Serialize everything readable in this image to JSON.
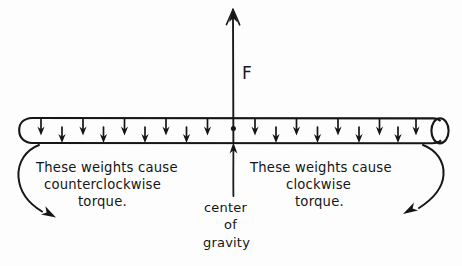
{
  "figure": {
    "title_visible": false,
    "background_color": "#fdfdfd",
    "ink_color": "#151515",
    "style": "hand-drawn pencil sketch"
  },
  "labels": {
    "force": "F",
    "left_line1": "These weights cause",
    "left_line2": "counterclockwise",
    "left_line3": "torque.",
    "right_line1": "These weights cause",
    "right_line2": "clockwise",
    "right_line3": "torque.",
    "cg_line1": "center",
    "cg_line2": "of",
    "cg_line3": "gravity"
  },
  "diagram_data": {
    "type": "free-body-diagram",
    "subject": "center of gravity of a uniform bar",
    "bar": {
      "shape": "horizontal rod with rounded left cap and elliptical right cap",
      "left_x": 19,
      "right_x": 448,
      "top_y": 118,
      "bottom_y": 143
    },
    "upward_force": {
      "name": "F",
      "direction": "up",
      "x": 233,
      "tail_y": 143,
      "tip_y": 9
    },
    "center_of_gravity": {
      "x": 233,
      "y": 129,
      "marker": "dot",
      "pointer_direction": "up",
      "pointer_tail_y": 196
    },
    "weight_arrows": {
      "direction": "down",
      "count": 20,
      "pattern": "staggered alternating long and short",
      "spacing_px": 21
    },
    "annotations": [
      {
        "side": "left",
        "text": "These weights cause counterclockwise torque.",
        "curve": "bracket curving down-left then arrowhead pointing down-right"
      },
      {
        "side": "right",
        "text": "These weights cause clockwise torque.",
        "curve": "bracket curving down-right then arrowhead pointing down-left"
      }
    ]
  }
}
